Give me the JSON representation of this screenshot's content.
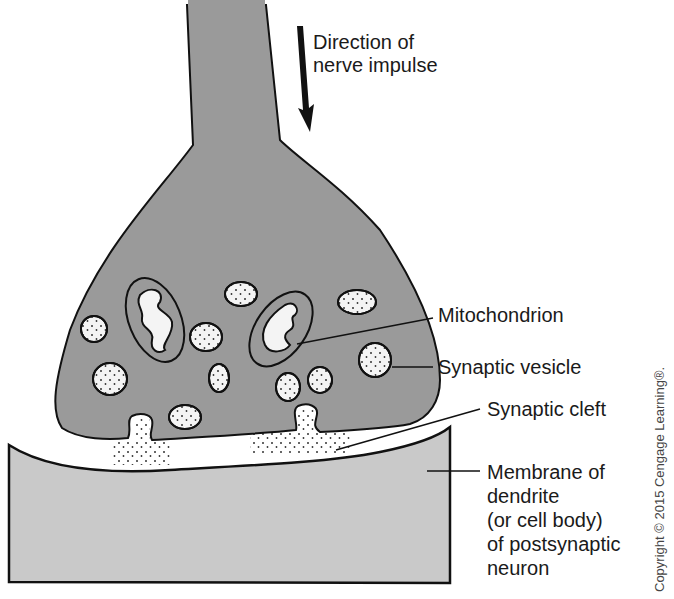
{
  "diagram": {
    "labels": {
      "direction_line1": "Direction of",
      "direction_line2": "nerve impulse",
      "mitochondrion": "Mitochondrion",
      "synaptic_vesicle": "Synaptic vesicle",
      "synaptic_cleft": "Synaptic cleft",
      "membrane_line1": "Membrane of",
      "membrane_line2": "dendrite",
      "membrane_line3": "(or cell body)",
      "membrane_line4": "of postsynaptic",
      "membrane_line5": "neuron"
    },
    "copyright": "Copyright © 2015 Cengage Learning®.",
    "colors": {
      "presynaptic_fill": "#9a9a9a",
      "postsynaptic_fill": "#c9c9c9",
      "vesicle_fill": "#f4f4f4",
      "outline": "#111111",
      "text": "#1a1a1a"
    },
    "parts": [
      "axon terminal",
      "mitochondria",
      "synaptic vesicles",
      "synaptic cleft",
      "postsynaptic membrane",
      "direction arrow"
    ]
  }
}
